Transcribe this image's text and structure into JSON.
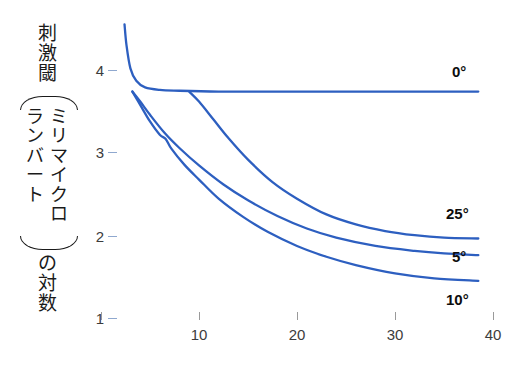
{
  "chart_data": {
    "type": "line",
    "title": "",
    "subtitle": "",
    "xlabel": "",
    "ylabel": "刺激閾（ミリマイクロランバート）の対数",
    "ylabel_parts": {
      "top": "刺激閾",
      "unit_right": "ミリマイクロ",
      "unit_left": "ランバート",
      "bottom": "の対数"
    },
    "xlim": [
      0,
      40
    ],
    "ylim": [
      0.8,
      4.6
    ],
    "grid": false,
    "legend_position": "inline-right",
    "xticks": [
      10,
      20,
      30,
      40
    ],
    "xtick_labels": [
      "10",
      "20",
      "30",
      "40"
    ],
    "yticks": [
      1,
      2,
      3,
      4
    ],
    "ytick_labels": [
      "1",
      "2",
      "3",
      "4"
    ],
    "line_color": "#2d5fc0",
    "series": [
      {
        "name": "0°",
        "label": "0°",
        "x": [
          2.4,
          2.6,
          3.0,
          3.6,
          4.5,
          6.0,
          8.0,
          12.0,
          16.0,
          20.0,
          25.0,
          30.0,
          35.0,
          38.5
        ],
        "y": [
          4.55,
          4.3,
          4.02,
          3.87,
          3.79,
          3.76,
          3.75,
          3.74,
          3.74,
          3.74,
          3.74,
          3.74,
          3.74,
          3.74
        ]
      },
      {
        "name": "25°",
        "label": "25°",
        "x": [
          9.0,
          10.0,
          11.5,
          13.0,
          15.0,
          17.5,
          20.0,
          23.0,
          26.0,
          29.0,
          32.0,
          35.0,
          38.5
        ],
        "y": [
          3.74,
          3.62,
          3.4,
          3.18,
          2.92,
          2.65,
          2.45,
          2.26,
          2.14,
          2.06,
          2.01,
          1.98,
          1.97
        ]
      },
      {
        "name": "5°",
        "label": "5°",
        "x": [
          3.2,
          4.0,
          5.0,
          6.5,
          8.0,
          10.0,
          12.5,
          15.0,
          18.0,
          21.0,
          24.0,
          28.0,
          32.0,
          35.0,
          38.5
        ],
        "y": [
          3.74,
          3.62,
          3.46,
          3.24,
          3.06,
          2.85,
          2.62,
          2.43,
          2.24,
          2.09,
          1.98,
          1.88,
          1.82,
          1.79,
          1.77
        ]
      },
      {
        "name": "10°",
        "label": "10°",
        "x": [
          3.2,
          4.0,
          5.0,
          6.0,
          6.6,
          7.2,
          8.5,
          10.0,
          12.0,
          14.5,
          17.0,
          20.0,
          23.0,
          26.0,
          30.0,
          34.0,
          38.5
        ],
        "y": [
          3.74,
          3.58,
          3.38,
          3.22,
          3.17,
          3.05,
          2.86,
          2.68,
          2.45,
          2.23,
          2.05,
          1.88,
          1.75,
          1.65,
          1.55,
          1.49,
          1.46
        ]
      }
    ],
    "series_label_positions": [
      {
        "label": "0°",
        "x_px": 452,
        "y_px": 63
      },
      {
        "label": "25°",
        "x_px": 446,
        "y_px": 205
      },
      {
        "label": "5°",
        "x_px": 452,
        "y_px": 248
      },
      {
        "label": "10°",
        "x_px": 446,
        "y_px": 291
      }
    ]
  },
  "axis_pixels": {
    "x_zero_px": 101,
    "x_per_unit_px": 9.8,
    "y_value4_px": 70,
    "y_per_unit_px": 83
  }
}
